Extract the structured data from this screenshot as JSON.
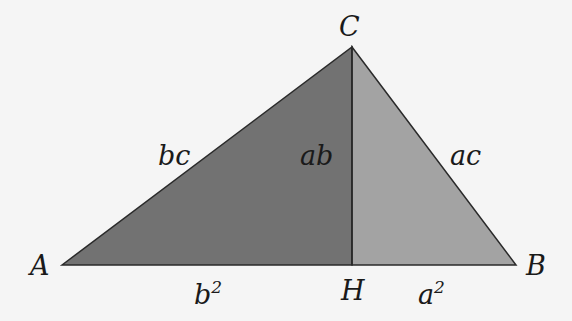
{
  "diagram": {
    "vertices": {
      "A": {
        "label": "A",
        "x": 62,
        "y": 265
      },
      "B": {
        "label": "B",
        "x": 516,
        "y": 265
      },
      "C": {
        "label": "C",
        "x": 352,
        "y": 47
      },
      "H": {
        "label": "H",
        "x": 352,
        "y": 265
      }
    },
    "edge_labels": {
      "AC": "bc",
      "CH": "ab",
      "CB": "ac",
      "AH_base": "b",
      "AH_exp": "2",
      "HB_base": "a",
      "HB_exp": "2"
    },
    "colors": {
      "left_triangle": "#727272",
      "right_triangle": "#a3a3a3",
      "stroke": "#2a2a2a",
      "background": "#f5f5f5"
    }
  }
}
